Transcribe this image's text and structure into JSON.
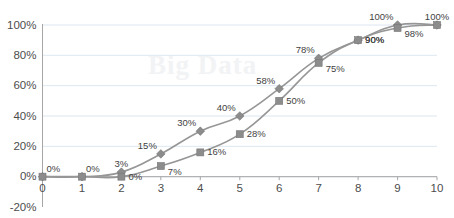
{
  "chart_data": {
    "type": "line",
    "title": "",
    "subtitle": "",
    "xlabel": "",
    "ylabel": "",
    "x": [
      0,
      1,
      2,
      3,
      4,
      5,
      6,
      7,
      8,
      9,
      10
    ],
    "xtick_labels": [
      "0",
      "1",
      "2",
      "3",
      "4",
      "5",
      "6",
      "7",
      "8",
      "9",
      "10"
    ],
    "ytick_labels": [
      "100%",
      "80%",
      "60%",
      "40%",
      "20%",
      "0%",
      "-20%"
    ],
    "ytick_values": [
      100,
      80,
      60,
      40,
      20,
      0,
      -20
    ],
    "ylim": [
      -20,
      100
    ],
    "xlim": [
      0,
      10
    ],
    "grid": "horizontal",
    "legend": "none",
    "series": [
      {
        "name": "diamond-series",
        "marker": "diamond",
        "color": "#8c8c8c",
        "values": [
          0,
          0,
          3,
          15,
          30,
          40,
          58,
          78,
          90,
          100,
          100
        ],
        "data_labels": [
          "0%",
          "0%",
          "3%",
          "15%",
          "30%",
          "40%",
          "58%",
          "78%",
          "90%",
          "100%",
          "100%"
        ],
        "label_positions": [
          "above-right",
          "above-right",
          "above",
          "above-left",
          "above-left",
          "above-left",
          "above-left",
          "above-left",
          "right",
          "above-left",
          "above"
        ]
      },
      {
        "name": "square-series",
        "marker": "square",
        "color": "#8c8c8c",
        "values": [
          0,
          0,
          0,
          7,
          16,
          28,
          50,
          75,
          90,
          98,
          100
        ],
        "data_labels": [
          "",
          "",
          "0%",
          "7%",
          "16%",
          "28%",
          "50%",
          "75%",
          "90%",
          "98%",
          ""
        ],
        "label_positions": [
          "",
          "",
          "right",
          "below-right",
          "right",
          "right",
          "right",
          "below-right",
          "right",
          "below-right",
          ""
        ]
      }
    ],
    "watermark_text": "Big Data",
    "colors": {
      "grid": "#dce6f1",
      "axis": "#a6a6a6",
      "series": "#8c8c8c",
      "line": "#969696",
      "tick_text": "#4d4d4d",
      "data_label_text": "#3f3f3f",
      "background": "#ffffff",
      "watermark": "#f2f3f5"
    }
  }
}
